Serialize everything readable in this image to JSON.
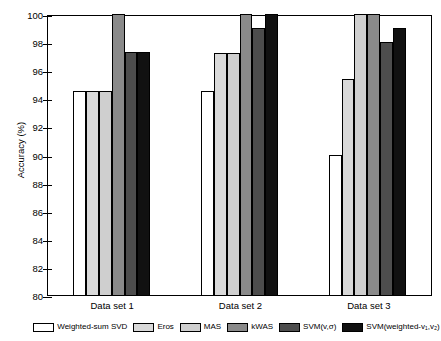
{
  "chart_data": {
    "type": "bar",
    "title": "",
    "xlabel": "",
    "ylabel": "Accuracy (%)",
    "ylim": [
      80,
      100
    ],
    "ytick_step": 2,
    "yticks": [
      80,
      82,
      84,
      86,
      88,
      90,
      92,
      94,
      96,
      98,
      100
    ],
    "ytick_labels": [
      "80",
      "82",
      "84",
      "86",
      "88",
      "90",
      "92",
      "94",
      "96",
      "98",
      "100"
    ],
    "categories": [
      "Data set 1",
      "Data set 2",
      "Data set 3"
    ],
    "grid": false,
    "legend_position": "bottom",
    "series": [
      {
        "name": "Weighted-sum SVD",
        "color": "#ffffff",
        "values": [
          94.5,
          94.5,
          90.0
        ]
      },
      {
        "name": "Eros",
        "color": "#d9d9d9",
        "values": [
          94.5,
          97.2,
          95.4
        ]
      },
      {
        "name": "MAS",
        "color": "#cfcfcf",
        "values": [
          94.5,
          97.2,
          100.0
        ]
      },
      {
        "name": "kWAS",
        "color": "#8a8a8a",
        "values": [
          100.0,
          100.0,
          100.0
        ]
      },
      {
        "name": "SVM(v,σ)",
        "color": "#4d4d4d",
        "values": [
          97.3,
          99.0,
          98.0
        ]
      },
      {
        "name": "SVM(weighted-v₁,v₂)",
        "color": "#111111",
        "values": [
          97.3,
          100.0,
          99.0
        ]
      }
    ]
  },
  "legend": {
    "items": [
      {
        "label": "Weighted-sum SVD",
        "color": "#ffffff"
      },
      {
        "label": "Eros",
        "color": "#d9d9d9"
      },
      {
        "label": "MAS",
        "color": "#cfcfcf"
      },
      {
        "label": "kWAS",
        "color": "#8a8a8a"
      },
      {
        "label": "SVM(v,σ)",
        "color": "#4d4d4d"
      },
      {
        "label": "SVM(weighted-v₁,v₂)",
        "color": "#111111"
      }
    ]
  },
  "axis": {
    "y_title": "Accuracy (%)",
    "axis_color": "#000000"
  }
}
